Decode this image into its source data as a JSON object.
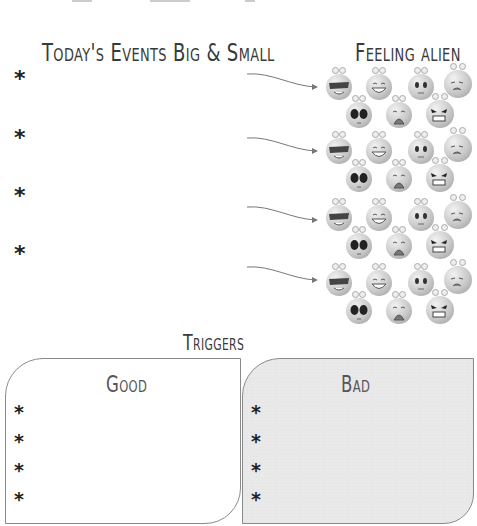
{
  "events_section": {
    "title": "Today's Events Big & Small",
    "bullets": [
      "*",
      "*",
      "*",
      "*"
    ]
  },
  "feelings_section": {
    "title": "Feeling alien",
    "rows": [
      {
        "arrow": "arrow-right-icon",
        "aliens": [
          "cool-sunglasses",
          "laughing",
          "surprised",
          "sad",
          "dark-eyed",
          "crying",
          "angry"
        ]
      },
      {
        "arrow": "arrow-right-icon",
        "aliens": [
          "cool-sunglasses",
          "laughing",
          "surprised",
          "sad",
          "dark-eyed",
          "crying",
          "angry"
        ]
      },
      {
        "arrow": "arrow-right-icon",
        "aliens": [
          "cool-sunglasses",
          "laughing",
          "surprised",
          "sad",
          "dark-eyed",
          "crying",
          "angry"
        ]
      },
      {
        "arrow": "arrow-right-icon",
        "aliens": [
          "cool-sunglasses",
          "laughing",
          "surprised",
          "sad",
          "dark-eyed",
          "crying",
          "angry"
        ]
      }
    ]
  },
  "triggers": {
    "title": "Triggers",
    "good": {
      "label": "Good",
      "bullets": [
        "*",
        "*",
        "*",
        "*"
      ]
    },
    "bad": {
      "label": "Bad",
      "bullets": [
        "*",
        "*",
        "*",
        "*"
      ]
    }
  },
  "colors": {
    "text": "#3a3a3a",
    "border": "#8a8a8a",
    "bad_fill": "#e9e9e9"
  }
}
